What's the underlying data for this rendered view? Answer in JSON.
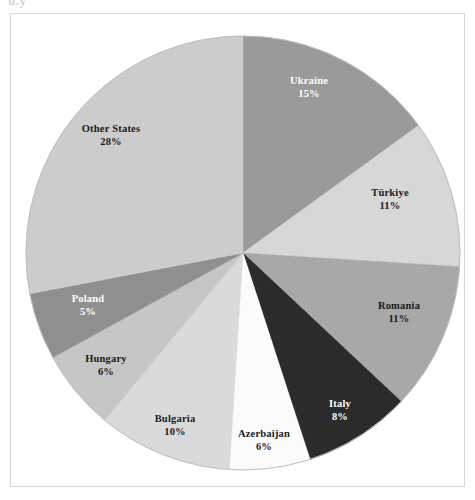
{
  "figure": {
    "clipped_text_fragment": "u.y",
    "frame_color": "#d8d8d8",
    "background": "#ffffff"
  },
  "chart_data": {
    "type": "pie",
    "title": "",
    "subtitle": "",
    "xlabel": "",
    "ylabel": "",
    "legend_position": "none",
    "grid": false,
    "start_angle_deg": 0,
    "direction": "clockwise",
    "units": "percent",
    "total": 100,
    "categories": [
      "Ukraine",
      "Türkiye",
      "Romania",
      "Italy",
      "Azerbaijan",
      "Bulgaria",
      "Hungary",
      "Poland",
      "Other States"
    ],
    "values": [
      15,
      11,
      11,
      8,
      6,
      10,
      6,
      5,
      28
    ],
    "slices": [
      {
        "name": "Ukraine",
        "value": 15,
        "value_label": "15%",
        "color": "#9a9a9a",
        "label_color": "#ffffff",
        "label_x": 309,
        "label_y": 88
      },
      {
        "name": "Türkiye",
        "value": 11,
        "value_label": "11%",
        "color": "#d7d7d7",
        "label_color": "#1a1a1a",
        "label_x": 390,
        "label_y": 200
      },
      {
        "name": "Romania",
        "value": 11,
        "value_label": "11%",
        "color": "#a8a8a8",
        "label_color": "#1a1a1a",
        "label_x": 399,
        "label_y": 313
      },
      {
        "name": "Italy",
        "value": 8,
        "value_label": "8%",
        "color": "#2b2b2b",
        "label_color": "#ffffff",
        "label_x": 340,
        "label_y": 411
      },
      {
        "name": "Azerbaijan",
        "value": 6,
        "value_label": "6%",
        "color": "#fbfbfb",
        "label_color": "#1a1a1a",
        "label_x": 264,
        "label_y": 441
      },
      {
        "name": "Bulgaria",
        "value": 10,
        "value_label": "10%",
        "color": "#dadada",
        "label_color": "#1a1a1a",
        "label_x": 175,
        "label_y": 426
      },
      {
        "name": "Hungary",
        "value": 6,
        "value_label": "6%",
        "color": "#c6c6c6",
        "label_color": "#1a1a1a",
        "label_x": 106,
        "label_y": 366
      },
      {
        "name": "Poland",
        "value": 5,
        "value_label": "5%",
        "color": "#8f8f8f",
        "label_color": "#ffffff",
        "label_x": 88,
        "label_y": 306
      },
      {
        "name": "Other States",
        "value": 28,
        "value_label": "28%",
        "color": "#cccccc",
        "label_color": "#1a1a1a",
        "label_x": 111,
        "label_y": 136
      }
    ],
    "geometry": {
      "center_x": 243,
      "center_y": 253,
      "radius": 217
    }
  }
}
